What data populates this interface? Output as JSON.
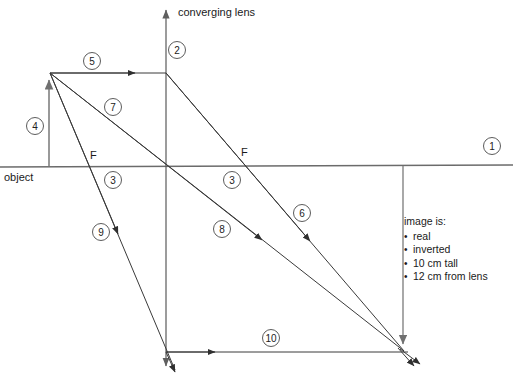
{
  "diagram": {
    "type": "ray-diagram",
    "title_label": "converging lens",
    "object_label": "object",
    "focal_point_left_label": "F",
    "focal_point_right_label": "F",
    "colors": {
      "ray": "#3a3a3a",
      "axis": "#6b6b6b",
      "lens": "#5a5a5a",
      "background": "#ffffff",
      "text": "#1a1a1a"
    },
    "geometry": {
      "lens_x": 166,
      "axis_y": 166,
      "object_x": 49,
      "object_top_y": 73,
      "focal_left_x": 97,
      "focal_right_x": 238,
      "image_x": 403,
      "image_bottom_y": 351
    },
    "steps": [
      {
        "id": "1",
        "label": "1",
        "cx": 492,
        "cy": 146
      },
      {
        "id": "2",
        "label": "2",
        "cx": 177,
        "cy": 50
      },
      {
        "id": "3a",
        "label": "3",
        "cx": 113,
        "cy": 180
      },
      {
        "id": "3b",
        "label": "3",
        "cx": 232,
        "cy": 180
      },
      {
        "id": "4",
        "label": "4",
        "cx": 35,
        "cy": 126
      },
      {
        "id": "5",
        "label": "5",
        "cx": 92,
        "cy": 61
      },
      {
        "id": "6",
        "label": "6",
        "cx": 302,
        "cy": 213
      },
      {
        "id": "7",
        "label": "7",
        "cx": 113,
        "cy": 107
      },
      {
        "id": "8",
        "label": "8",
        "cx": 222,
        "cy": 229
      },
      {
        "id": "9",
        "label": "9",
        "cx": 101,
        "cy": 232
      },
      {
        "id": "10",
        "label": "10",
        "cx": 271,
        "cy": 338
      }
    ],
    "image_note": {
      "heading": "image is:",
      "bullets": [
        "real",
        "inverted",
        "10 cm tall",
        "12 cm from lens"
      ]
    }
  }
}
